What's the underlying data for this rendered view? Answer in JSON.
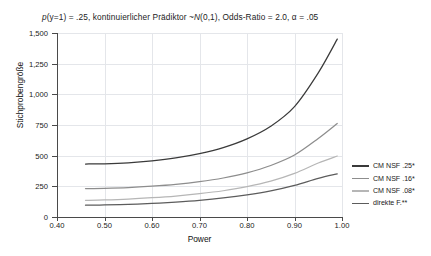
{
  "chart_data": {
    "type": "line",
    "title": "p(y=1) = .25, kontinuierlicher Prädiktor ~N(0,1), Odds-Ratio = 2.0, α = .05",
    "title_prefix_italic": "p",
    "xlabel": "Power",
    "ylabel": "Stichprobengröße",
    "xlim": [
      0.4,
      1.0
    ],
    "ylim": [
      0,
      1500
    ],
    "xticks": [
      "0.40",
      "0.50",
      "0.60",
      "0.70",
      "0.80",
      "0.90",
      "1.00"
    ],
    "xtick_values": [
      0.4,
      0.5,
      0.6,
      0.7,
      0.8,
      0.9,
      1.0
    ],
    "yticks": [
      "0",
      "250",
      "500",
      "750",
      "1,000",
      "1,250",
      "1,500"
    ],
    "ytick_values": [
      0,
      250,
      500,
      750,
      1000,
      1250,
      1500
    ],
    "grid": true,
    "legend_position": "right",
    "x": [
      0.46,
      0.5,
      0.55,
      0.6,
      0.65,
      0.7,
      0.75,
      0.8,
      0.85,
      0.9,
      0.95,
      0.99
    ],
    "series": [
      {
        "name": "CM NSF .25*",
        "color": "#3a3a3a",
        "values": [
          432,
          434,
          442,
          458,
          482,
          517,
          566,
          637,
          740,
          900,
          1175,
          1450
        ]
      },
      {
        "name": "CM NSF .16*",
        "color": "#8d8d8d",
        "values": [
          232,
          234,
          240,
          251,
          266,
          288,
          318,
          360,
          420,
          505,
          640,
          762
        ]
      },
      {
        "name": "CM NSF .08*",
        "color": "#b6b6b6",
        "values": [
          136,
          139,
          146,
          157,
          171,
          190,
          214,
          247,
          292,
          355,
          440,
          497
        ]
      },
      {
        "name": "direkte F.**",
        "color": "#5c5c5c",
        "values": [
          96,
          98,
          103,
          111,
          122,
          136,
          155,
          180,
          213,
          258,
          315,
          352
        ]
      }
    ]
  },
  "legend": {
    "items": [
      {
        "label": "CM NSF .25*",
        "color": "#3a3a3a"
      },
      {
        "label": "CM NSF .16*",
        "color": "#8d8d8d"
      },
      {
        "label": "CM NSF .08*",
        "color": "#b6b6b6"
      },
      {
        "label": "direkte F.**",
        "color": "#5c5c5c"
      }
    ]
  }
}
